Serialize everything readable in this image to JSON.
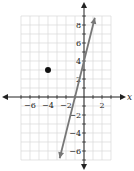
{
  "chart_data": {
    "type": "line",
    "title": "",
    "xlabel": "x",
    "ylabel": "y",
    "xlim": [
      -7,
      3
    ],
    "ylim": [
      -7,
      9
    ],
    "grid": true,
    "x_ticks": [
      "-6",
      "-4",
      "-2",
      "2"
    ],
    "y_ticks": [
      "8",
      "6",
      "4",
      "2",
      "-2",
      "-4",
      "-6"
    ],
    "series": [
      {
        "name": "line",
        "type": "line",
        "points": [
          [
            -2.7,
            -6.8
          ],
          [
            1.2,
            8.8
          ]
        ],
        "equation": "y = 4x + 4",
        "color": "#777777"
      }
    ],
    "points": [
      {
        "x": -4,
        "y": 3,
        "color": "#111111"
      }
    ]
  }
}
